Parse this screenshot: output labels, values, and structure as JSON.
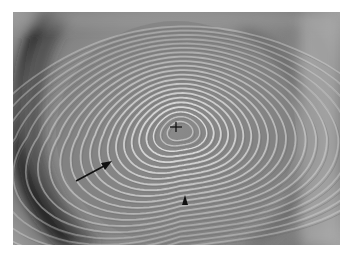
{
  "figure": {
    "frame": {
      "x": 13,
      "y": 12,
      "width": 327,
      "height": 233
    },
    "colors": {
      "background": "#8e8e8e",
      "dark_limbus": "#1e1e1e",
      "ring_light": "#e4e4e4",
      "ring_dark": "#6a6a6a",
      "annotation": "#111111"
    },
    "rings": {
      "center": {
        "x": 176,
        "y": 127
      },
      "count": 22
    },
    "annotations": [
      {
        "type": "arrow",
        "name": "arrow-annotation",
        "from": {
          "x": 76,
          "y": 181
        },
        "to": {
          "x": 111,
          "y": 162
        }
      },
      {
        "type": "arrowhead",
        "name": "arrowhead-annotation",
        "tip": {
          "x": 185,
          "y": 195
        }
      },
      {
        "type": "crosshair",
        "name": "center-crosshair",
        "at": {
          "x": 176,
          "y": 127
        }
      }
    ]
  }
}
